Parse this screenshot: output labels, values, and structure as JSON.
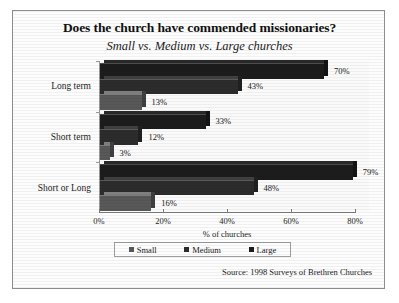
{
  "chart_data": {
    "type": "bar",
    "orientation": "horizontal",
    "grouped": true,
    "title": "Does the church have commended missionaries?",
    "subtitle": "Small vs. Medium vs. Large churches",
    "xlabel": "% of churches",
    "ylabel": "",
    "xlim": [
      0,
      80
    ],
    "xticks": [
      "0%",
      "20%",
      "40%",
      "60%",
      "80%"
    ],
    "xtick_values": [
      0,
      20,
      40,
      60,
      80
    ],
    "grid": false,
    "legend_position": "bottom",
    "categories": [
      "Long term",
      "Short term",
      "Short or Long"
    ],
    "series": [
      {
        "name": "Small",
        "values": [
          13,
          3,
          16
        ],
        "labels": [
          "13%",
          "3%",
          "16%"
        ],
        "color": "#585858"
      },
      {
        "name": "Medium",
        "values": [
          43,
          12,
          48
        ],
        "labels": [
          "43%",
          "12%",
          "48%"
        ],
        "color": "#2c2c2c"
      },
      {
        "name": "Large",
        "values": [
          70,
          33,
          79
        ],
        "labels": [
          "70%",
          "33%",
          "79%"
        ],
        "color": "#1c1c1c"
      }
    ],
    "annotations": [
      "Source: 1998 Surveys of Brethren Churches"
    ]
  },
  "legend": {
    "items": [
      {
        "label": "Small"
      },
      {
        "label": "Medium"
      },
      {
        "label": "Large"
      }
    ]
  },
  "source": {
    "text": "Source: 1998 Surveys of Brethren Churches"
  },
  "colors": {
    "small": "#585858",
    "medium": "#2c2c2c",
    "large": "#1c1c1c",
    "frame": "#8d8d8d",
    "axis": "#7d7d7d",
    "background": "#fdfdfd"
  }
}
